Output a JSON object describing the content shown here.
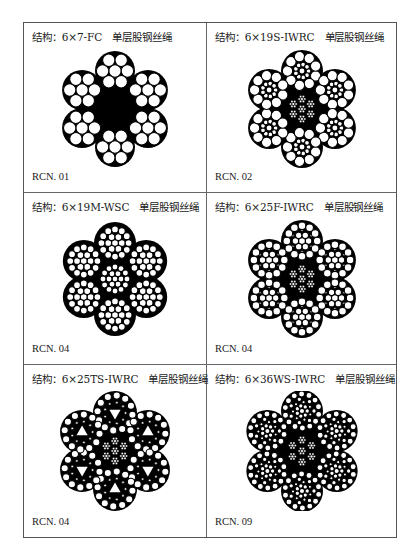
{
  "page": {
    "cells": [
      {
        "label_prefix": "结构：",
        "structure": "6×7-FC",
        "type": "单层股钢丝绳",
        "code": "RCN. 01",
        "diagram": "6x7-fc-cross-section"
      },
      {
        "label_prefix": "结构：",
        "structure": "6×19S-IWRC",
        "type": "单层股钢丝绳",
        "code": "RCN. 02",
        "diagram": "6x19s-iwrc-cross-section"
      },
      {
        "label_prefix": "结构：",
        "structure": "6×19M-WSC",
        "type": "单层股钢丝绳",
        "code": "RCN. 04",
        "diagram": "6x19m-wsc-cross-section"
      },
      {
        "label_prefix": "结构：",
        "structure": "6×25F-IWRC",
        "type": "单层股钢丝绳",
        "code": "RCN. 04",
        "diagram": "6x25f-iwrc-cross-section"
      },
      {
        "label_prefix": "结构：",
        "structure": "6×25TS-IWRC",
        "type": "单层股钢丝绳",
        "code": "RCN. 04",
        "diagram": "6x25ts-iwrc-cross-section"
      },
      {
        "label_prefix": "结构：",
        "structure": "6×36WS-IWRC",
        "type": "单层股钢丝绳",
        "code": "RCN. 09",
        "diagram": "6x36ws-iwrc-cross-section"
      }
    ]
  },
  "colors": {
    "wire_fill": "#ffffff",
    "core_fill": "#000000",
    "border": "#555555"
  }
}
